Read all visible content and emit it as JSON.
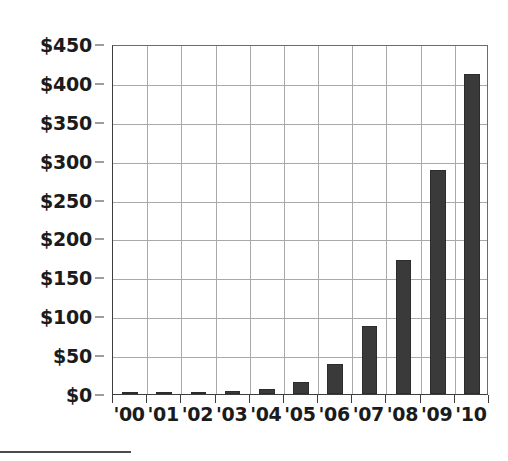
{
  "chart_data": {
    "type": "bar",
    "title": "",
    "subtitle": "",
    "xlabel": "",
    "ylabel": "",
    "categories": [
      "'00",
      "'01",
      "'02",
      "'03",
      "'04",
      "'05",
      "'06",
      "'07",
      "'08",
      "'09",
      "'10"
    ],
    "values": [
      0.5,
      1,
      2,
      4,
      7,
      15,
      38,
      88,
      172,
      288,
      412
    ],
    "value_prefix": "$",
    "ylim": [
      0,
      450
    ],
    "ytick_values": [
      0,
      50,
      100,
      150,
      200,
      250,
      300,
      350,
      400,
      450
    ],
    "ytick_labels": [
      "$0",
      "$50",
      "$100",
      "$150",
      "$200",
      "$250",
      "$300",
      "$350",
      "$400",
      "$450"
    ],
    "grid": true,
    "grid_axis": "both",
    "legend": false,
    "legend_position": "none",
    "series": [
      {
        "name": "",
        "values": [
          0.5,
          1,
          2,
          4,
          7,
          15,
          38,
          88,
          172,
          288,
          412
        ],
        "color": "#3a3a3a"
      }
    ],
    "annotations": []
  },
  "style": {
    "bar_color": "#3a3a3a",
    "grid_color": "#a9a9a9",
    "axis_color": "#3d3d3d",
    "text_color": "#1b1b1b",
    "background": "#ffffff"
  },
  "footer": {
    "rule": ""
  }
}
